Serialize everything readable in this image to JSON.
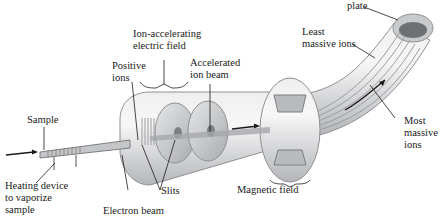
{
  "diagram": {
    "labels": {
      "plate": "plate",
      "least_massive_1": "Least",
      "least_massive_2": "massive ions",
      "ion_accel_1": "Ion-accelerating",
      "ion_accel_2": "electric field",
      "positive_1": "Positive",
      "positive_2": "ions",
      "accel_beam_1": "Accelerated",
      "accel_beam_2": "ion beam",
      "sample": "Sample",
      "heating_1": "Heating device",
      "heating_2": "to vaporize",
      "heating_3": "sample",
      "electron_beam": "Electron beam",
      "slits": "Slits",
      "magnetic_field": "Magnetic field",
      "most_massive_1": "Most",
      "most_massive_2": "massive",
      "most_massive_3": "ions"
    },
    "colors": {
      "tube": "#d9dadb",
      "tube_edge": "#8e9093",
      "beam": "#9b9da0",
      "ink": "#1a1a1a"
    }
  }
}
